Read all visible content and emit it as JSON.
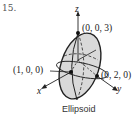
{
  "problem_number": "15.",
  "axes": {
    "x": "x",
    "y": "y",
    "z": "z"
  },
  "points": [
    {
      "label": "(0, 0, 3)"
    },
    {
      "label": "(1, 0, 0)"
    },
    {
      "label": "(0, 2, 0)"
    }
  ],
  "caption": "Ellipsoid",
  "colors": {
    "fill": "#d9d9d9",
    "stroke": "#222222"
  }
}
